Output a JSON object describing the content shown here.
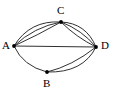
{
  "figure": {
    "type": "multigraph-diagram",
    "background_color": "#ffffff",
    "stroke_color": "#1a1a1a",
    "label_color": "#000000",
    "width": 114,
    "height": 102
  },
  "nodes": [
    {
      "id": "A",
      "label": "A",
      "x": 14,
      "y": 46,
      "label_x": 2,
      "label_y": 40
    },
    {
      "id": "B",
      "label": "B",
      "x": 47,
      "y": 72,
      "label_x": 43,
      "label_y": 78
    },
    {
      "id": "C",
      "label": "C",
      "x": 61,
      "y": 22,
      "label_x": 57,
      "label_y": 5
    },
    {
      "id": "D",
      "label": "D",
      "x": 96,
      "y": 47,
      "label_x": 101,
      "label_y": 40
    }
  ],
  "edges": [
    {
      "id": "e1",
      "from": "A",
      "to": "C",
      "style": "curve",
      "bend": "upper",
      "path": "M14,46 Q30,20 61,22"
    },
    {
      "id": "e2",
      "from": "A",
      "to": "C",
      "style": "curve",
      "bend": "middle",
      "path": "M14,46 Q34,27 61,22"
    },
    {
      "id": "e3",
      "from": "A",
      "to": "C",
      "style": "curve",
      "bend": "lower",
      "path": "M14,46 Q38,35 61,22"
    },
    {
      "id": "e4",
      "from": "C",
      "to": "D",
      "style": "curve",
      "bend": "upper",
      "path": "M61,22 Q86,23 96,47"
    },
    {
      "id": "e5",
      "from": "C",
      "to": "D",
      "style": "curve",
      "bend": "middle",
      "path": "M61,22 Q82,30 96,47"
    },
    {
      "id": "e6",
      "from": "C",
      "to": "D",
      "style": "curve",
      "bend": "lower",
      "path": "M61,22 Q76,37 96,47"
    },
    {
      "id": "e7",
      "from": "A",
      "to": "D",
      "style": "straight",
      "bend": "none",
      "path": "M14,46 L96,47"
    },
    {
      "id": "e8",
      "from": "A",
      "to": "B",
      "style": "curve",
      "bend": "lower",
      "path": "M14,46 Q23,66 47,72"
    },
    {
      "id": "e9",
      "from": "B",
      "to": "D",
      "style": "curve",
      "bend": "upper",
      "path": "M47,72 Q72,66 96,47"
    },
    {
      "id": "e10",
      "from": "B",
      "to": "D",
      "style": "curve",
      "bend": "outer",
      "path": "M47,72 Q83,73 96,47"
    }
  ],
  "node_radius": 1.9
}
